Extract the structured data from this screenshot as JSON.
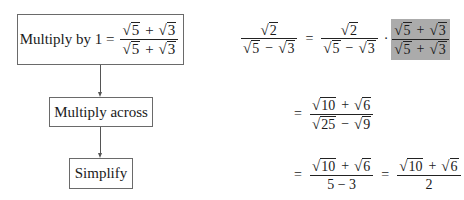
{
  "flowchart": {
    "steps": [
      {
        "label": "Multiply by 1 =",
        "fraction": {
          "num": [
            "5",
            "+",
            "3"
          ],
          "den": [
            "5",
            "+",
            "3"
          ]
        }
      },
      {
        "label": "Multiply across"
      },
      {
        "label": "Simplify"
      }
    ]
  },
  "math": {
    "line1": {
      "lhs": {
        "num": "2",
        "den": [
          "5",
          "−",
          "3"
        ]
      },
      "eq": "=",
      "rhs": {
        "num": "2",
        "den": [
          "5",
          "−",
          "3"
        ]
      },
      "dot": "·",
      "highlight": {
        "num": [
          "5",
          "+",
          "3"
        ],
        "den": [
          "5",
          "+",
          "3"
        ],
        "color": "#ababab"
      }
    },
    "line2": {
      "eq": "=",
      "num": [
        "10",
        "+",
        "6"
      ],
      "den": [
        "25",
        "−",
        "9"
      ]
    },
    "line3": {
      "eq1": "=",
      "frac1": {
        "num": [
          "10",
          "+",
          "6"
        ],
        "den": "5 − 3"
      },
      "eq2": "=",
      "frac2": {
        "num": [
          "10",
          "+",
          "6"
        ],
        "den": "2"
      }
    }
  },
  "sqrt_symbol": "√"
}
